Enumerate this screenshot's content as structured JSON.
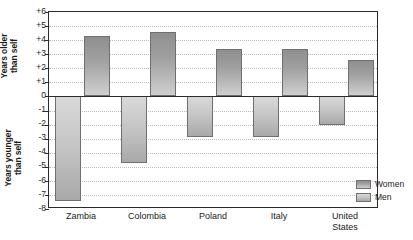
{
  "chart_data": {
    "type": "bar",
    "title": "",
    "xlabel": "",
    "ylabel_upper": "Years older\nthan self",
    "ylabel_lower": "Years younger\nthan self",
    "categories": [
      "Zambia",
      "Colombia",
      "Poland",
      "Italy",
      "United\nStates"
    ],
    "series": [
      {
        "name": "Women",
        "values": [
          -7.4,
          -4.7,
          -2.9,
          -2.9,
          -2.0
        ]
      },
      {
        "name": "Men",
        "values": [
          4.3,
          4.6,
          3.4,
          3.4,
          2.6
        ]
      }
    ],
    "ylim": [
      -8,
      6
    ],
    "ytick_labels": [
      "+6",
      "+5",
      "+4",
      "+3",
      "+2",
      "+1",
      "0",
      "-1",
      "-2",
      "-3",
      "-4",
      "-5",
      "-6",
      "-7",
      "-8"
    ],
    "ytick_values": [
      6,
      5,
      4,
      3,
      2,
      1,
      0,
      -1,
      -2,
      -3,
      -4,
      -5,
      -6,
      -7,
      -8
    ],
    "grid": true,
    "legend_position": "bottom-right",
    "colors": {
      "women": "#a9a9a9",
      "men": "#8f8f8f",
      "axis": "#2b2b2b",
      "gridline": "#b9b9c8",
      "background": "#ffffff"
    }
  },
  "legend": {
    "entries": [
      {
        "label": "Women",
        "key": "women"
      },
      {
        "label": "Men",
        "key": "men"
      }
    ]
  }
}
